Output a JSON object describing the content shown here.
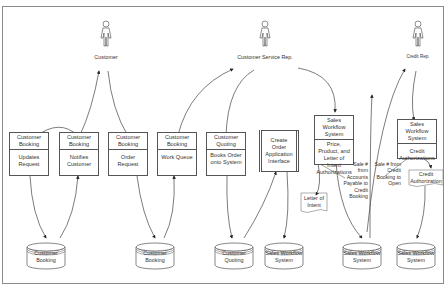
{
  "actors": [
    {
      "id": "customer",
      "label": "Customer"
    },
    {
      "id": "csr",
      "label": "Customer Service Rep."
    },
    {
      "id": "credit",
      "label": "Credit Rep."
    }
  ],
  "processes": [
    {
      "header": "Customer Booking",
      "body": "Updates Request"
    },
    {
      "header": "Customer Booking",
      "body": "Notifies Customer"
    },
    {
      "header": "Customer Booking",
      "body": "Order Request"
    },
    {
      "header": "Customer Booking",
      "body": "Work Queue"
    },
    {
      "header": "Customer Quoting",
      "body": "Books Order onto System"
    },
    {
      "header": "",
      "body": "Create Order Application Interface"
    },
    {
      "header": "Sales Workflow System",
      "body": "Price, Product, and Letter of Intent Authorizations"
    },
    {
      "header": "Sales Workflow System",
      "body": "Credit Authorizations"
    }
  ],
  "documents": [
    {
      "label": "Letter of Intent"
    },
    {
      "label": "Credit Authorization"
    }
  ],
  "notes": [
    {
      "text": "Sale # from Accounts Payable to Credit Booking"
    },
    {
      "text": "Sale # from Credit Booking to Open"
    }
  ],
  "databases": [
    {
      "label": "Customer Booking"
    },
    {
      "label": "Customer Booking"
    },
    {
      "label": "Customer Quoting"
    },
    {
      "label": "Sales Workflow System"
    },
    {
      "label": "Sales Workflow System"
    },
    {
      "label": "Sales Workflow System"
    }
  ],
  "colors": {
    "line": "#444444",
    "border": "#8a8a8a",
    "text": "#333333"
  }
}
